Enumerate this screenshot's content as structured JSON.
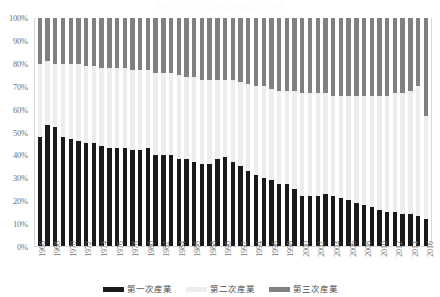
{
  "chart_data": {
    "type": "bar",
    "subtype": "stacked-100-percent",
    "title": "産業三部門別就業者数構成比の推移",
    "xlabel": "",
    "ylabel": "",
    "ylim": [
      0,
      100
    ],
    "ytick_labels": [
      "100%",
      "90%",
      "80%",
      "70%",
      "60%",
      "50%",
      "40%",
      "30%",
      "20%",
      "10%",
      "0%"
    ],
    "ytick_values": [
      100,
      90,
      80,
      70,
      60,
      50,
      40,
      30,
      20,
      10,
      0
    ],
    "grid": false,
    "legend_position": "bottom",
    "xtick_label_interval": 2,
    "xtick_rotation": -90,
    "categories": [
      1966,
      1967,
      1968,
      1969,
      1970,
      1971,
      1972,
      1973,
      1974,
      1975,
      1976,
      1977,
      1978,
      1979,
      1980,
      1981,
      1982,
      1983,
      1984,
      1985,
      1986,
      1987,
      1988,
      1989,
      1990,
      1991,
      1992,
      1993,
      1994,
      1995,
      1996,
      1997,
      1998,
      1999,
      2000,
      2001,
      2002,
      2003,
      2004,
      2005,
      2006,
      2007,
      2008,
      2009,
      2010,
      2011,
      2012,
      2013,
      2014,
      2015,
      2016
    ],
    "xtick_labels": [
      "1966",
      "",
      "1968",
      "",
      "1970",
      "",
      "1972",
      "",
      "1974",
      "",
      "1976",
      "",
      "1978",
      "",
      "1980",
      "",
      "1982",
      "",
      "1984",
      "",
      "1986",
      "",
      "1988",
      "",
      "1990",
      "",
      "1992",
      "",
      "1994",
      "",
      "1996",
      "",
      "1998",
      "",
      "2000",
      "",
      "2002",
      "",
      "2004",
      "",
      "2006",
      "",
      "2008",
      "",
      "2010",
      "",
      "2012",
      "",
      "2014",
      "",
      "2016"
    ],
    "series": [
      {
        "name": "第一次産業",
        "color": "#1a1a1a",
        "values": [
          48,
          53,
          52,
          48,
          47,
          46,
          45,
          45,
          44,
          43,
          43,
          43,
          42,
          42,
          43,
          40,
          40,
          40,
          38,
          38,
          37,
          36,
          36,
          38,
          39,
          37,
          35,
          33,
          31,
          30,
          29,
          27,
          27,
          25,
          22,
          22,
          22,
          23,
          22,
          21,
          20,
          19,
          18,
          17,
          16,
          15,
          15,
          14,
          14,
          13,
          12
        ]
      },
      {
        "name": "第二次産業",
        "color": "#ededed",
        "values": [
          32,
          28,
          28,
          32,
          33,
          34,
          34,
          34,
          34,
          35,
          35,
          35,
          35,
          35,
          34,
          36,
          36,
          36,
          37,
          36,
          37,
          37,
          37,
          35,
          34,
          36,
          37,
          38,
          39,
          40,
          40,
          41,
          41,
          43,
          45,
          45,
          45,
          44,
          44,
          45,
          46,
          47,
          48,
          49,
          50,
          51,
          52,
          53,
          54,
          57,
          45
        ]
      },
      {
        "name": "第三次産業",
        "color": "#808080",
        "values": [
          20,
          19,
          20,
          20,
          20,
          20,
          21,
          21,
          22,
          22,
          22,
          22,
          23,
          23,
          23,
          24,
          24,
          24,
          25,
          26,
          26,
          27,
          27,
          27,
          27,
          27,
          28,
          29,
          30,
          30,
          31,
          32,
          32,
          32,
          33,
          33,
          33,
          33,
          34,
          34,
          34,
          34,
          34,
          34,
          34,
          34,
          33,
          33,
          32,
          30,
          43
        ]
      }
    ],
    "legend": [
      {
        "label": "第一次産業",
        "color": "#1a1a1a"
      },
      {
        "label": "第二次産業",
        "color": "#ededed"
      },
      {
        "label": "第三次産業",
        "color": "#808080"
      }
    ]
  }
}
